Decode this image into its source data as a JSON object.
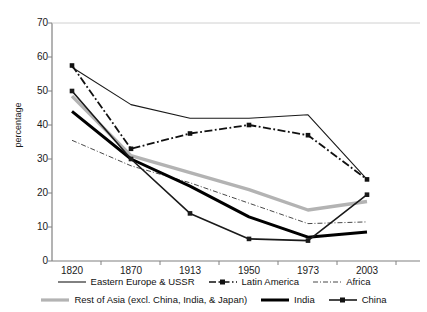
{
  "chart_data": {
    "type": "line",
    "title": "",
    "xlabel": "",
    "ylabel": "percentage",
    "categories": [
      "1820",
      "1870",
      "1913",
      "1950",
      "1973",
      "2003"
    ],
    "ylim": [
      0,
      70
    ],
    "yticks": [
      0,
      10,
      20,
      30,
      40,
      50,
      60,
      70
    ],
    "grid": false,
    "legend_position": "bottom",
    "series": [
      {
        "name": "Eastern Europe & USSR",
        "style": "solid-thin",
        "color": "#1a1a1a",
        "markers": "none",
        "values": [
          57,
          46,
          42,
          42,
          43,
          24
        ]
      },
      {
        "name": "Latin America",
        "style": "dash-dot-thick",
        "color": "#111111",
        "markers": "square",
        "values": [
          57.5,
          33,
          37.5,
          40,
          37,
          24
        ]
      },
      {
        "name": "Africa",
        "style": "dash-dot-thin",
        "color": "#333333",
        "markers": "none",
        "values": [
          35.5,
          28,
          23,
          17,
          11,
          11.5
        ]
      },
      {
        "name": "Rest of Asia (excl. China, India, & Japan)",
        "style": "solid-thick-grey",
        "color": "#b3b3b3",
        "markers": "none",
        "values": [
          48.5,
          31,
          26,
          21,
          15,
          17.5
        ]
      },
      {
        "name": "India",
        "style": "solid-extrathick",
        "color": "#000000",
        "markers": "none",
        "values": [
          44,
          30,
          22,
          13,
          7,
          8.5
        ]
      },
      {
        "name": "China",
        "style": "solid-medium",
        "color": "#1a1a1a",
        "markers": "square",
        "values": [
          50,
          30,
          14,
          6.5,
          6,
          19.5
        ]
      }
    ]
  },
  "axes": {
    "y_title": "percentage",
    "y_tick_labels": [
      "70",
      "60",
      "50",
      "40",
      "30",
      "20",
      "10",
      "0"
    ],
    "x_tick_labels": [
      "1820",
      "1870",
      "1913",
      "1950",
      "1973",
      "2003"
    ]
  },
  "legend": {
    "row1": [
      {
        "label": "Eastern Europe & USSR",
        "swatch": "solid-thin-swatch"
      },
      {
        "label": "Latin America",
        "swatch": "dash-dot-square-swatch"
      },
      {
        "label": "Africa",
        "swatch": "dash-dot-thin-swatch"
      }
    ],
    "row2": [
      {
        "label": "Rest of Asia (excl. China, India, & Japan)",
        "swatch": "solid-thick-grey-swatch"
      },
      {
        "label": "India",
        "swatch": "solid-extrathick-swatch"
      },
      {
        "label": "China",
        "swatch": "solid-medium-square-swatch"
      }
    ]
  },
  "colors": {
    "axis": "#808080",
    "grey_series": "#b3b3b3",
    "black_series": "#111111",
    "background": "#ffffff"
  }
}
